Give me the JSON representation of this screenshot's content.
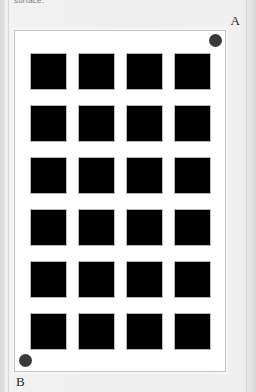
{
  "caption": {
    "text": "surface."
  },
  "card": {
    "background_color": "#eeeeee",
    "panel_background_color": "#ffffff",
    "panel_border_color": "#c4c4c4"
  },
  "grid": {
    "rows": 6,
    "columns": 4,
    "total_cells": 24,
    "cell_color": "#000000",
    "cell_border_color": "#b9b9b9",
    "cells": [
      {
        "row": 1,
        "col": 1
      },
      {
        "row": 1,
        "col": 2
      },
      {
        "row": 1,
        "col": 3
      },
      {
        "row": 1,
        "col": 4
      },
      {
        "row": 2,
        "col": 1
      },
      {
        "row": 2,
        "col": 2
      },
      {
        "row": 2,
        "col": 3
      },
      {
        "row": 2,
        "col": 4
      },
      {
        "row": 3,
        "col": 1
      },
      {
        "row": 3,
        "col": 2
      },
      {
        "row": 3,
        "col": 3
      },
      {
        "row": 3,
        "col": 4
      },
      {
        "row": 4,
        "col": 1
      },
      {
        "row": 4,
        "col": 2
      },
      {
        "row": 4,
        "col": 3
      },
      {
        "row": 4,
        "col": 4
      },
      {
        "row": 5,
        "col": 1
      },
      {
        "row": 5,
        "col": 2
      },
      {
        "row": 5,
        "col": 3
      },
      {
        "row": 5,
        "col": 4
      },
      {
        "row": 6,
        "col": 1
      },
      {
        "row": 6,
        "col": 2
      },
      {
        "row": 6,
        "col": 3
      },
      {
        "row": 6,
        "col": 4
      }
    ]
  },
  "markers": {
    "a": {
      "label": "A",
      "position": "top-right",
      "dot_color": "#3a3a3a"
    },
    "b": {
      "label": "B",
      "position": "bottom-left",
      "dot_color": "#3a3a3a"
    }
  }
}
